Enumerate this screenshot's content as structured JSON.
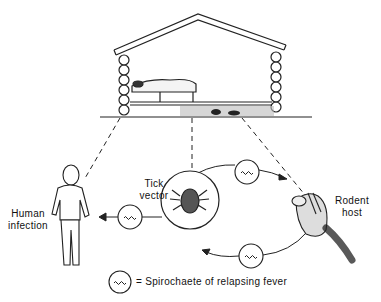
{
  "labels": {
    "human": [
      "Human",
      "infection"
    ],
    "tick": [
      "Tick",
      "vector"
    ],
    "rodent": [
      "Rodent",
      "host"
    ]
  },
  "legend": {
    "symbol": "spirochaete-symbol",
    "text": "= Spirochaete of relapsing fever"
  }
}
